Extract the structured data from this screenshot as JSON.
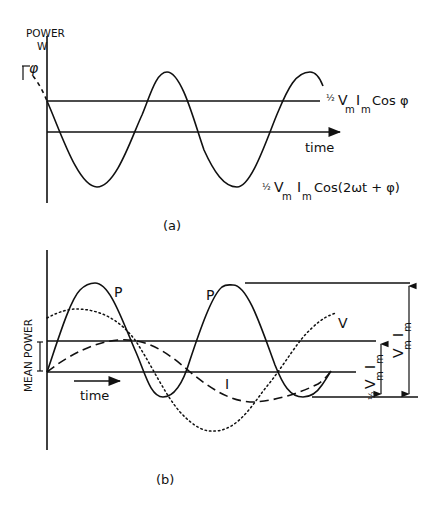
{
  "figure_a": {
    "y_axis_label_line1": "POWER",
    "y_axis_label_line2": "W",
    "phi_marker": "φ",
    "mean_line_label": {
      "frac": "½",
      "v": "V",
      "v_sub": "m",
      "i": "I",
      "i_sub": "m",
      "rest": "Cos φ"
    },
    "time_axis_label": "time",
    "curve_label": {
      "frac": "½",
      "v": "V",
      "v_sub": "m",
      "i": "I",
      "i_sub": "m",
      "rest": "Cos(2ωt + φ)"
    },
    "caption": "(a)"
  },
  "figure_b": {
    "y_axis_label": "MEAN POWER",
    "time_arrow_label": "time",
    "power_peak_label_1": "P",
    "power_peak_label_2": "P",
    "voltage_label": "V",
    "current_label": "I",
    "half_dim_label": {
      "frac": "½",
      "v": "V",
      "v_sub": "m",
      "i": "I",
      "i_sub": "m"
    },
    "full_dim_label": {
      "v": "V",
      "v_sub": "m",
      "i": "I",
      "i_sub": "m"
    },
    "caption": "(b)"
  },
  "colors": {
    "ink": "#111111",
    "background": "#ffffff"
  }
}
